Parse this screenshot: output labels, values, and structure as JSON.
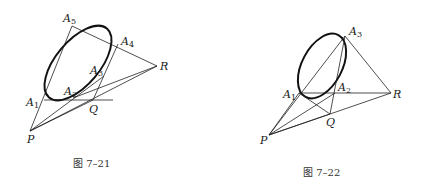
{
  "figures": [
    {
      "id": "fig-7-21",
      "caption": "图 7–21",
      "labels": {
        "A1": {
          "base": "A",
          "sub": "1"
        },
        "A2": {
          "base": "A",
          "sub": "2"
        },
        "A3": {
          "base": "A",
          "sub": "3"
        },
        "A4": {
          "base": "A",
          "sub": "4"
        },
        "A5": {
          "base": "A",
          "sub": "5"
        },
        "P": {
          "base": "P"
        },
        "Q": {
          "base": "Q"
        },
        "R": {
          "base": "R"
        }
      }
    },
    {
      "id": "fig-7-22",
      "caption": "图 7–22",
      "labels": {
        "A1": {
          "base": "A",
          "sub": "1"
        },
        "A2": {
          "base": "A",
          "sub": "2"
        },
        "A3": {
          "base": "A",
          "sub": "3"
        },
        "P": {
          "base": "P"
        },
        "Q": {
          "base": "Q"
        },
        "R": {
          "base": "R"
        }
      }
    }
  ]
}
